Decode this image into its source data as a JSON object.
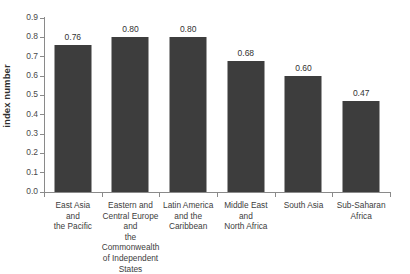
{
  "chart_data": {
    "type": "bar",
    "title": "",
    "subtitle": "",
    "xlabel": "",
    "ylabel": "index number",
    "ylim": [
      0.0,
      0.9
    ],
    "grid": false,
    "legend": null,
    "y_ticks": [
      "0.0",
      "0.1",
      "0.2",
      "0.3",
      "0.4",
      "0.5",
      "0.6",
      "0.7",
      "0.8",
      "0.9"
    ],
    "y_tick_values": [
      0.0,
      0.1,
      0.2,
      0.3,
      0.4,
      0.5,
      0.6,
      0.7,
      0.8,
      0.9
    ],
    "categories": [
      "East Asia and the Pacific",
      "Eastern and Central Europe and the Commonwealth of Independent States",
      "Latin America and the Caribbean",
      "Middle East and North Africa",
      "South Asia",
      "Sub-Saharan Africa"
    ],
    "category_lines": [
      [
        "East Asia",
        "and",
        "the Pacific"
      ],
      [
        "Eastern and",
        "Central Europe and",
        "the Commonwealth",
        "of Independent States"
      ],
      [
        "Latin America",
        "and the",
        "Caribbean"
      ],
      [
        "Middle East",
        "and",
        "North Africa"
      ],
      [
        "South Asia"
      ],
      [
        "Sub-Saharan",
        "Africa"
      ]
    ],
    "values": [
      0.76,
      0.8,
      0.8,
      0.68,
      0.6,
      0.47
    ],
    "value_labels": [
      "0.76",
      "0.80",
      "0.80",
      "0.68",
      "0.60",
      "0.47"
    ],
    "bar_color": "#3d3d3d",
    "axis_color": "#8a8a8a",
    "background_color": "#ffffff"
  }
}
